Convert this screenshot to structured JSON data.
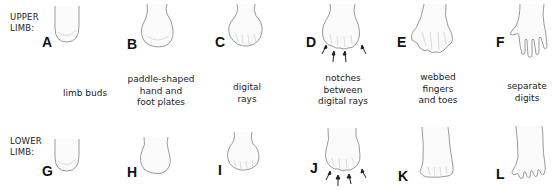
{
  "rows": {
    "upper": {
      "label_line1": "UPPER",
      "label_line2": "LIMB:"
    },
    "lower": {
      "label_line1": "LOWER",
      "label_line2": "LIMB:"
    }
  },
  "stages": [
    {
      "upper": "A",
      "lower": "G",
      "caption": [
        "limb buds"
      ]
    },
    {
      "upper": "B",
      "lower": "H",
      "caption": [
        "paddle-shaped",
        "hand and",
        "foot plates"
      ]
    },
    {
      "upper": "C",
      "lower": "I",
      "caption": [
        "digital",
        "rays"
      ]
    },
    {
      "upper": "D",
      "lower": "J",
      "caption": [
        "notches",
        "between",
        "digital rays"
      ]
    },
    {
      "upper": "E",
      "lower": "K",
      "caption": [
        "webbed",
        "fingers",
        "and toes"
      ]
    },
    {
      "upper": "F",
      "lower": "L",
      "caption": [
        "separate",
        "digits"
      ]
    }
  ]
}
